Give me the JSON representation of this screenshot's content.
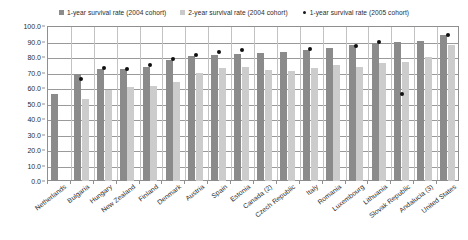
{
  "legend": {
    "position": "top-center",
    "items": [
      {
        "label": "1-year survival rate (2004 cohort)",
        "marker": "square",
        "color": "#8b8b8b",
        "icon": "square-swatch-icon"
      },
      {
        "label": "2-year survival rate (2004 cohort)",
        "marker": "square",
        "color": "#cccccc",
        "icon": "square-swatch-icon"
      },
      {
        "label": "1-year survival rate (2005 cohort)",
        "marker": "dot",
        "color": "#101010",
        "icon": "dot-swatch-icon"
      }
    ]
  },
  "axis": {
    "y_ticks": [
      "100.0",
      "90.0",
      "80.0",
      "70.0",
      "60.0",
      "50.0",
      "40.0",
      "30.0",
      "20.0",
      "10.0",
      "0.0"
    ]
  },
  "chart_data": {
    "type": "bar",
    "title": "",
    "xlabel": "",
    "ylabel": "",
    "ylim": [
      0,
      100
    ],
    "ytick_step": 10,
    "grid": true,
    "legend_position": "top-center",
    "categories": [
      "Netherlands",
      "Bulgaria",
      "Hungary",
      "New Zealand",
      "Finland",
      "Denmark",
      "Austria",
      "Spain",
      "Estonia",
      "Canada (2)",
      "Czech Republic",
      "Italy",
      "Romania",
      "Luxembourg",
      "Lithuania",
      "Slovak Republic",
      "Andalucia (3)",
      "United States"
    ],
    "series": [
      {
        "name": "1-year survival rate (2004 cohort)",
        "type": "bar",
        "color": "#8b8b8b",
        "values": [
          56.0,
          69.0,
          72.0,
          72.5,
          73.5,
          78.0,
          80.5,
          81.0,
          82.0,
          82.5,
          83.5,
          84.5,
          85.5,
          88.0,
          89.0,
          89.5,
          90.5,
          94.0
        ]
      },
      {
        "name": "2-year survival rate (2004 cohort)",
        "type": "bar",
        "color": "#cccccc",
        "values": [
          null,
          53.0,
          59.0,
          60.5,
          61.5,
          64.0,
          70.0,
          73.0,
          73.5,
          71.5,
          71.0,
          73.0,
          75.0,
          73.5,
          76.0,
          76.5,
          80.0,
          88.0
        ]
      },
      {
        "name": "1-year survival rate (2005 cohort)",
        "type": "scatter",
        "color": "#101010",
        "values": [
          null,
          66.0,
          73.0,
          72.0,
          75.0,
          79.0,
          81.0,
          83.0,
          84.5,
          null,
          null,
          85.0,
          null,
          87.0,
          90.0,
          56.0,
          null,
          94.0
        ]
      }
    ]
  }
}
